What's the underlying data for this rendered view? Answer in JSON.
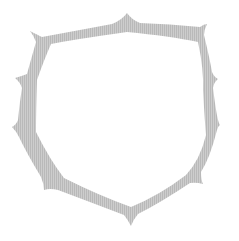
{
  "graphic": {
    "label": "Spiked shield frame",
    "fill_color": "#c8c8c8",
    "stripe_color": "#b4b4b4",
    "background": "#ffffff",
    "inner_color": "#ffffff"
  }
}
